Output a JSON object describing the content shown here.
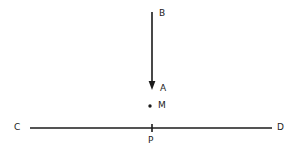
{
  "figure": {
    "type": "geometry-diagram",
    "background_color": "#ffffff",
    "stroke_color": "#1b1b1b",
    "label_color": "#1b1b1b",
    "labels": {
      "b": "B",
      "a": "A",
      "m": "M",
      "c": "C",
      "d": "D",
      "p": "P"
    },
    "elements": {
      "vertical_ray_name": "ray AB",
      "horizontal_line_name": "line CD",
      "point_m_name": "point M",
      "point_p_name": "point P",
      "arrowhead_name": "arrowhead at A"
    },
    "geometry": {
      "vertical_x": 152,
      "vertical_top_y": 12,
      "vertical_bottom_y": 88,
      "horizontal_y": 128,
      "horizontal_left_x": 30,
      "horizontal_right_x": 272,
      "point_m_x": 150,
      "point_m_y": 106,
      "point_p_x": 152,
      "tick_half_height": 4
    }
  }
}
